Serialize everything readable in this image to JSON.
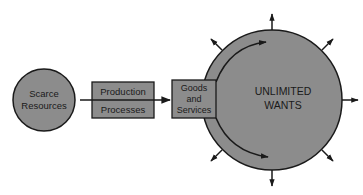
{
  "diagram": {
    "nodes": {
      "scarce_resources": {
        "line1": "Scarce",
        "line2": "Resources"
      },
      "production_processes": {
        "line1": "Production",
        "line2": "Processes"
      },
      "goods_and_services": {
        "line1": "Goods",
        "line2": "and",
        "line3": "Services"
      },
      "unlimited_wants": {
        "line1": "UNLIMITED",
        "line2": "WANTS"
      }
    },
    "colors": {
      "fill": "#8c8c8c",
      "stroke": "#1a1a1a",
      "background": "#ffffff"
    },
    "edges": [
      {
        "from": "scarce_resources",
        "to": "goods_and_services",
        "via": "production_processes"
      },
      {
        "from": "goods_and_services",
        "to": "unlimited_wants",
        "note": "curved arrows wrapping around circle (upper and lower)"
      },
      {
        "from": "unlimited_wants",
        "to": "outward",
        "note": "8 radial arrows pointing outward"
      }
    ]
  }
}
